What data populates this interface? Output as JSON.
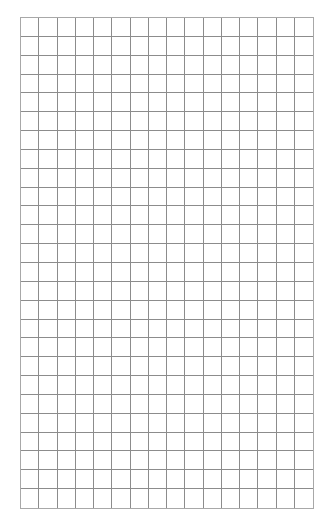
{
  "grid": {
    "columns": 16,
    "rows": 26,
    "line_color": "#8c8c8c",
    "border_color": "#a8a8a8",
    "background": "#ffffff"
  }
}
